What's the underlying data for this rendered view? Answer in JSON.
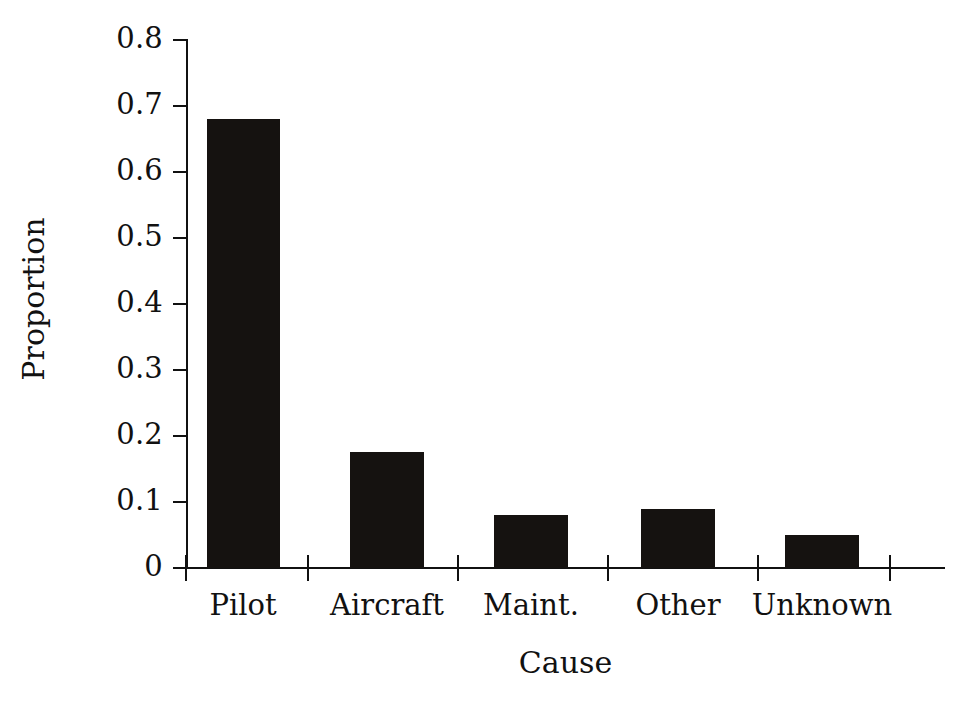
{
  "chart_data": {
    "type": "bar",
    "title": "",
    "subtitle": "",
    "xlabel": "Cause",
    "ylabel": "Proportion",
    "categories": [
      "Pilot",
      "Aircraft",
      "Maint.",
      "Other",
      "Unknown"
    ],
    "values": [
      0.68,
      0.175,
      0.08,
      0.09,
      0.05
    ],
    "ylim": [
      0,
      0.8
    ],
    "xlim_categories": 5,
    "y_ticks": [
      0,
      0.1,
      0.2,
      0.3,
      0.4,
      0.5,
      0.6,
      0.7,
      0.8
    ],
    "y_tick_labels": [
      "0",
      "0.1",
      "0.2",
      "0.3",
      "0.4",
      "0.5",
      "0.6",
      "0.7",
      "0.8"
    ],
    "grid": false,
    "legend": null,
    "legend_position": "none",
    "bar_color": "#151210",
    "axis_color": "#111111",
    "background_color": "#ffffff",
    "annotations": []
  },
  "axes": {
    "y_title": "Proportion",
    "x_title": "Cause"
  },
  "bars": [
    {
      "label": "Pilot",
      "value": 0.68,
      "value_label": "0.68"
    },
    {
      "label": "Aircraft",
      "value": 0.175,
      "value_label": "0.175"
    },
    {
      "label": "Maint.",
      "value": 0.08,
      "value_label": "0.08"
    },
    {
      "label": "Other",
      "value": 0.09,
      "value_label": "0.09"
    },
    {
      "label": "Unknown",
      "value": 0.05,
      "value_label": "0.05"
    }
  ],
  "y_ticks": [
    {
      "label": "0.8"
    },
    {
      "label": "0.7"
    },
    {
      "label": "0.6"
    },
    {
      "label": "0.5"
    },
    {
      "label": "0.4"
    },
    {
      "label": "0.3"
    },
    {
      "label": "0.2"
    },
    {
      "label": "0.1"
    },
    {
      "label": "0"
    }
  ]
}
